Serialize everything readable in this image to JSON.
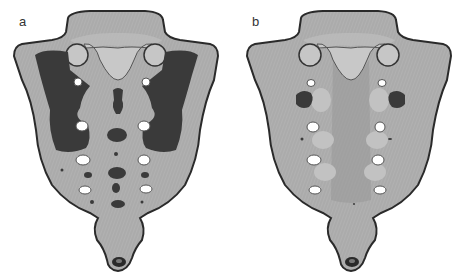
{
  "figure": {
    "panels": [
      {
        "label": "a",
        "description": "sacrum render with extensive dark regions"
      },
      {
        "label": "b",
        "description": "sacrum render with few dark regions"
      }
    ],
    "colors": {
      "bone_fill": "#a9a9a9",
      "bone_light": "#c4c4c4",
      "bone_mid": "#9a9a9a",
      "outline": "#2a2a2a",
      "dark_region": "#3a3a3a",
      "foramen": "#ffffff",
      "background": "#ffffff"
    }
  }
}
